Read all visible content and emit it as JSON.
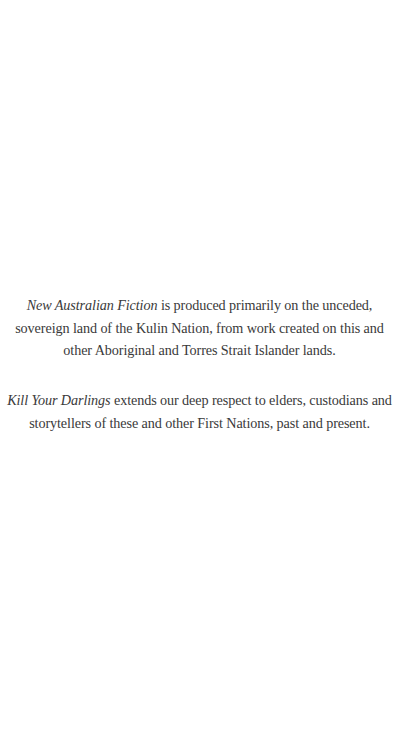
{
  "acknowledgement": {
    "paragraph1": {
      "lines": [
        {
          "italic": "New Australian Fiction",
          "text": " is produced primarily on the unceded,"
        },
        {
          "italic": "",
          "text": "sovereign land of the Kulin Nation, from work created on this and"
        },
        {
          "italic": "",
          "text": "other Aboriginal and Torres Strait Islander lands."
        }
      ]
    },
    "paragraph2": {
      "lines": [
        {
          "italic": "Kill Your Darlings",
          "text": " extends our deep respect to elders, custodians and"
        },
        {
          "italic": "",
          "text": "storytellers of these and other First Nations, past and present."
        }
      ]
    }
  }
}
